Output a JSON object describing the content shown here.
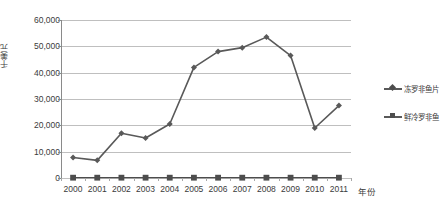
{
  "chart_data": {
    "type": "line",
    "title": "",
    "xlabel": "年份",
    "ylabel": "千美元",
    "categories": [
      "2000",
      "2001",
      "2002",
      "2003",
      "2004",
      "2005",
      "2006",
      "2007",
      "2008",
      "2009",
      "2010",
      "2011"
    ],
    "ylim": [
      0,
      60000
    ],
    "ytick_labels": [
      "60,000",
      "50,000",
      "40,000",
      "30,000",
      "20,000",
      "10,000",
      "0"
    ],
    "ytick_values": [
      60000,
      50000,
      40000,
      30000,
      20000,
      10000,
      0
    ],
    "grid": true,
    "legend_position": "right",
    "series": [
      {
        "name": "冻罗非鱼片",
        "marker": "diamond",
        "color": "#595959",
        "values": [
          7800,
          6700,
          17000,
          15200,
          20500,
          42000,
          48000,
          49500,
          53500,
          46500,
          19000,
          27500
        ]
      },
      {
        "name": "鲜冷罗非鱼",
        "marker": "square",
        "color": "#4d4d4d",
        "values": [
          120,
          120,
          120,
          120,
          120,
          120,
          120,
          120,
          120,
          120,
          120,
          120
        ]
      }
    ]
  },
  "legend": {
    "items": [
      {
        "label": "冻罗非鱼片"
      },
      {
        "label": "鲜冷罗非鱼"
      }
    ]
  },
  "axes": {
    "y_title": "千美元",
    "x_title": "年份"
  }
}
